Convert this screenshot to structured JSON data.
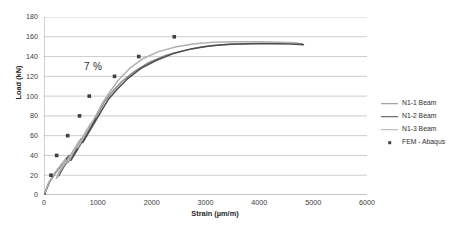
{
  "chart_data": {
    "type": "line",
    "title": "",
    "xlabel": "Strain (µm/m)",
    "ylabel": "Load (kN)",
    "xlim": [
      0,
      6000
    ],
    "ylim": [
      0,
      180
    ],
    "xticks": [
      "0",
      "1000",
      "2000",
      "3000",
      "4000",
      "5000",
      "6000"
    ],
    "yticks": [
      "0",
      "20",
      "40",
      "60",
      "80",
      "100",
      "120",
      "140",
      "160",
      "180"
    ],
    "grid": "horizontal",
    "legend_position": "right",
    "annotations": [
      {
        "text": "7 %",
        "x": 830,
        "y": 128
      }
    ],
    "series": [
      {
        "name": "N1-1 Beam",
        "type": "line",
        "color": "#8c8c8c",
        "points": [
          [
            0,
            0
          ],
          [
            90,
            12
          ],
          [
            200,
            22
          ],
          [
            330,
            31
          ],
          [
            430,
            38
          ],
          [
            380,
            31
          ],
          [
            300,
            24
          ],
          [
            250,
            18
          ],
          [
            330,
            26
          ],
          [
            470,
            38
          ],
          [
            600,
            49
          ],
          [
            690,
            57
          ],
          [
            620,
            50
          ],
          [
            520,
            40
          ],
          [
            450,
            33
          ],
          [
            560,
            43
          ],
          [
            700,
            56
          ],
          [
            810,
            66
          ],
          [
            900,
            74
          ],
          [
            830,
            67
          ],
          [
            730,
            57
          ],
          [
            660,
            50
          ],
          [
            780,
            61
          ],
          [
            920,
            74
          ],
          [
            1030,
            85
          ],
          [
            1120,
            94
          ],
          [
            1260,
            104
          ],
          [
            1450,
            115
          ],
          [
            1680,
            125
          ],
          [
            1950,
            134
          ],
          [
            2250,
            141
          ],
          [
            2600,
            146
          ],
          [
            2950,
            150
          ],
          [
            3300,
            152
          ],
          [
            3700,
            153
          ],
          [
            4100,
            153.5
          ],
          [
            4500,
            153.5
          ],
          [
            4800,
            153
          ]
        ]
      },
      {
        "name": "N1-2 Beam",
        "type": "line",
        "color": "#4d4d4d",
        "points": [
          [
            0,
            0
          ],
          [
            100,
            13
          ],
          [
            220,
            23
          ],
          [
            360,
            33
          ],
          [
            470,
            40
          ],
          [
            410,
            33
          ],
          [
            330,
            26
          ],
          [
            280,
            20
          ],
          [
            360,
            28
          ],
          [
            510,
            40
          ],
          [
            640,
            51
          ],
          [
            740,
            59
          ],
          [
            670,
            52
          ],
          [
            570,
            42
          ],
          [
            500,
            35
          ],
          [
            610,
            45
          ],
          [
            750,
            58
          ],
          [
            860,
            68
          ],
          [
            960,
            77
          ],
          [
            890,
            70
          ],
          [
            790,
            60
          ],
          [
            720,
            53
          ],
          [
            840,
            64
          ],
          [
            980,
            77
          ],
          [
            1100,
            88
          ],
          [
            1200,
            97
          ],
          [
            1360,
            107
          ],
          [
            1560,
            118
          ],
          [
            1800,
            128
          ],
          [
            2080,
            136
          ],
          [
            2400,
            143
          ],
          [
            2750,
            148
          ],
          [
            3100,
            151
          ],
          [
            3450,
            152.5
          ],
          [
            3850,
            153
          ],
          [
            4250,
            153
          ],
          [
            4600,
            152.8
          ],
          [
            4820,
            152
          ]
        ]
      },
      {
        "name": "N1-3 Beam",
        "type": "line",
        "color": "#b0b0b0",
        "points": [
          [
            0,
            0
          ],
          [
            85,
            12
          ],
          [
            190,
            21
          ],
          [
            310,
            30
          ],
          [
            400,
            36
          ],
          [
            350,
            30
          ],
          [
            275,
            23
          ],
          [
            230,
            17
          ],
          [
            310,
            25
          ],
          [
            440,
            36
          ],
          [
            570,
            47
          ],
          [
            655,
            55
          ],
          [
            590,
            48
          ],
          [
            495,
            38
          ],
          [
            430,
            32
          ],
          [
            535,
            42
          ],
          [
            670,
            54
          ],
          [
            775,
            64
          ],
          [
            865,
            72
          ],
          [
            800,
            65
          ],
          [
            700,
            55
          ],
          [
            630,
            48
          ],
          [
            745,
            59
          ],
          [
            880,
            72
          ],
          [
            990,
            83
          ],
          [
            1075,
            92
          ],
          [
            1205,
            103
          ],
          [
            1380,
            116
          ],
          [
            1590,
            128
          ],
          [
            1840,
            138
          ],
          [
            2130,
            145
          ],
          [
            2460,
            150
          ],
          [
            2800,
            153
          ],
          [
            3150,
            154.5
          ],
          [
            3550,
            155
          ],
          [
            3950,
            155
          ],
          [
            4350,
            154.5
          ],
          [
            4700,
            154
          ]
        ]
      },
      {
        "name": "FEM - Abaqus",
        "type": "scatter",
        "color": "#404040",
        "points": [
          [
            0,
            0
          ],
          [
            130,
            20
          ],
          [
            235,
            40
          ],
          [
            440,
            60
          ],
          [
            660,
            80
          ],
          [
            840,
            100
          ],
          [
            1310,
            120
          ],
          [
            1760,
            140
          ],
          [
            2420,
            160
          ]
        ]
      }
    ]
  },
  "legend": {
    "items": [
      {
        "label": "N1-1 Beam",
        "marker": "line",
        "color": "#8c8c8c"
      },
      {
        "label": "N1-2 Beam",
        "marker": "line",
        "color": "#4d4d4d"
      },
      {
        "label": "N1-3 Beam",
        "marker": "line",
        "color": "#b0b0b0"
      },
      {
        "label": "FEM - Abaqus",
        "marker": "square",
        "color": "#404040"
      }
    ]
  },
  "axes": {
    "y_title": "Load (kN)",
    "x_title": "Strain (µm/m)"
  },
  "colors": {
    "grid": "#b8b8b8",
    "axis": "#9a9a9a",
    "text": "#3b3b3b",
    "background": "#ffffff"
  }
}
